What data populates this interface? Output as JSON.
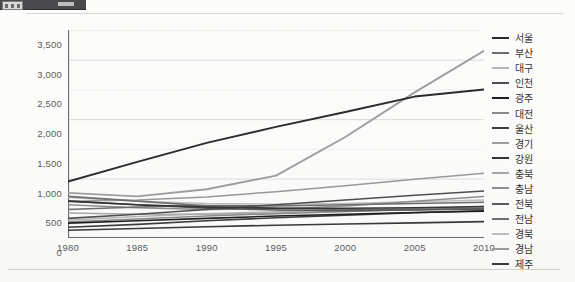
{
  "toolbar": {
    "present": true
  },
  "chart_data": {
    "type": "line",
    "title": "",
    "xlabel": "",
    "ylabel": "",
    "x": [
      1980,
      1985,
      1990,
      1995,
      2000,
      2005,
      2010
    ],
    "x_tick_labels": [
      "1980",
      "1985",
      "1990",
      "1995",
      "2000",
      "2005",
      "2010"
    ],
    "y_tick_labels": [
      "0",
      "500",
      "1,000",
      "1,500",
      "2,000",
      "2,500",
      "3,000",
      "3,500"
    ],
    "y_ticks": [
      0,
      500,
      1000,
      1500,
      2000,
      2500,
      3000,
      3500
    ],
    "ylim": [
      0,
      3500
    ],
    "xlim": [
      1980,
      2010
    ],
    "grid": true,
    "legend_position": "right",
    "series": [
      {
        "name": "서울",
        "color": "#2b2b2b",
        "width": 1.9,
        "values": [
          950,
          1280,
          1600,
          1870,
          2120,
          2380,
          2500
        ]
      },
      {
        "name": "부산",
        "color": "#6e6e6e",
        "width": 1.5,
        "values": [
          480,
          520,
          545,
          540,
          560,
          580,
          600
        ]
      },
      {
        "name": "대구",
        "color": "#b5b5b5",
        "width": 1.5,
        "values": [
          300,
          360,
          410,
          440,
          470,
          500,
          520
        ]
      },
      {
        "name": "인천",
        "color": "#4f4f4f",
        "width": 1.6,
        "values": [
          330,
          400,
          480,
          560,
          640,
          720,
          790
        ]
      },
      {
        "name": "광주",
        "color": "#1f1f1f",
        "width": 1.6,
        "values": [
          250,
          290,
          330,
          370,
          400,
          430,
          450
        ]
      },
      {
        "name": "대전",
        "color": "#8a8a8a",
        "width": 1.5,
        "values": [
          270,
          320,
          370,
          410,
          445,
          480,
          505
        ]
      },
      {
        "name": "울산",
        "color": "#3d3d3d",
        "width": 1.6,
        "values": [
          180,
          230,
          290,
          340,
          385,
          425,
          460
        ]
      },
      {
        "name": "경기",
        "color": "#9e9e9e",
        "width": 1.9,
        "values": [
          760,
          700,
          820,
          1050,
          1700,
          2450,
          3150
        ]
      },
      {
        "name": "강원",
        "color": "#343434",
        "width": 1.6,
        "values": [
          620,
          560,
          520,
          500,
          500,
          510,
          530
        ]
      },
      {
        "name": "충북",
        "color": "#a8a8a8",
        "width": 1.5,
        "values": [
          420,
          400,
          400,
          420,
          450,
          490,
          530
        ]
      },
      {
        "name": "충남",
        "color": "#8f8f8f",
        "width": 1.5,
        "values": [
          560,
          510,
          480,
          490,
          540,
          620,
          700
        ]
      },
      {
        "name": "전북",
        "color": "#5a5a5a",
        "width": 1.6,
        "values": [
          620,
          560,
          500,
          470,
          460,
          470,
          490
        ]
      },
      {
        "name": "전남",
        "color": "#707070",
        "width": 1.6,
        "values": [
          700,
          620,
          540,
          500,
          480,
          480,
          495
        ]
      },
      {
        "name": "경북",
        "color": "#bdbdbd",
        "width": 1.5,
        "values": [
          680,
          620,
          580,
          570,
          580,
          610,
          640
        ]
      },
      {
        "name": "경남",
        "color": "#999999",
        "width": 1.5,
        "values": [
          620,
          640,
          690,
          780,
          880,
          990,
          1090
        ]
      },
      {
        "name": "제주",
        "color": "#3a3a3a",
        "width": 1.6,
        "values": [
          130,
          160,
          190,
          215,
          235,
          255,
          275
        ]
      }
    ]
  }
}
